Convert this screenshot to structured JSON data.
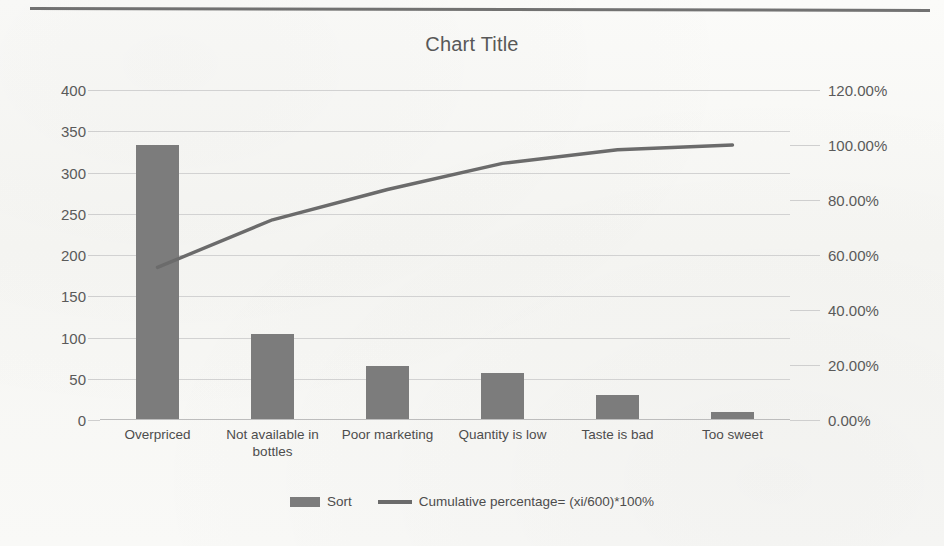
{
  "chart_data": {
    "type": "bar",
    "title": "Chart Title",
    "xlabel": "",
    "ylabel": "",
    "grid": true,
    "legend_position": "bottom",
    "categories": [
      "Overpriced",
      "Not available in bottles",
      "Poor marketing",
      "Quantity is low",
      "Taste is bad",
      "Too sweet"
    ],
    "series": [
      {
        "name": "Sort",
        "type": "bar",
        "axis": "left",
        "values": [
          333,
          104,
          66,
          57,
          30,
          10
        ]
      },
      {
        "name": "Cumulative percentage= (xi/600)*100%",
        "type": "line",
        "axis": "right",
        "values": [
          55.5,
          72.8,
          83.8,
          93.3,
          98.3,
          100.0
        ]
      }
    ],
    "left_axis": {
      "min": 0,
      "max": 400,
      "step": 50,
      "ticks": [
        "0",
        "50",
        "100",
        "150",
        "200",
        "250",
        "300",
        "350",
        "400"
      ]
    },
    "right_axis": {
      "min": 0,
      "max": 120,
      "step": 20,
      "ticks": [
        "0.00%",
        "20.00%",
        "40.00%",
        "60.00%",
        "80.00%",
        "100.00%",
        "120.00%"
      ]
    },
    "colors": {
      "bar": "#7c7c7c",
      "line": "#6b6b6b",
      "gridline": "#d2d2d2",
      "text": "#4d4d4d",
      "background": "#f8f8f6"
    }
  },
  "legend": {
    "items": [
      {
        "label": "Sort",
        "marker": "bar-swatch"
      },
      {
        "label": "Cumulative percentage= (xi/600)*100%",
        "marker": "line-swatch"
      }
    ]
  }
}
